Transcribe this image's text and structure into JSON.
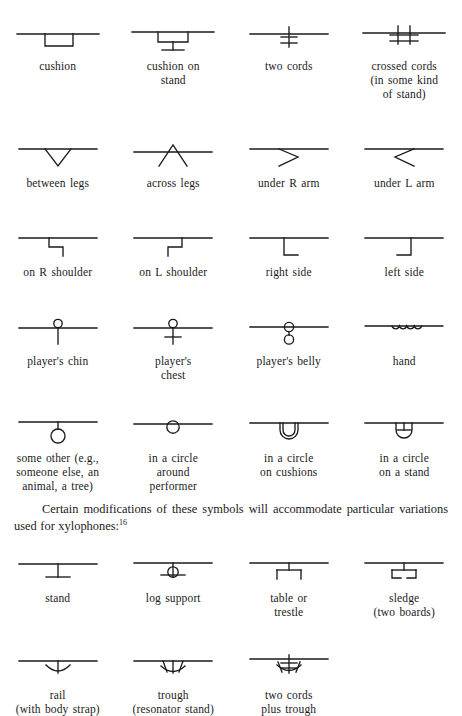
{
  "document": {
    "title": "Notation symbols for instrument support and playing position",
    "paragraph": {
      "text": "Certain modifications of these symbols will accommodate particular variations used for xylophones:",
      "footnote_marker": "16"
    }
  },
  "symbol_rows": [
    {
      "row_id": "row-1",
      "symbols": [
        {
          "name": "cushion",
          "caption_lines": [
            "cushion"
          ],
          "glyph": "cushion"
        },
        {
          "name": "cushion-on-stand",
          "caption_lines": [
            "cushion on",
            "stand"
          ],
          "glyph": "cushion-on-stand"
        },
        {
          "name": "two-cords",
          "caption_lines": [
            "two cords"
          ],
          "glyph": "two-cords"
        },
        {
          "name": "crossed-cords",
          "caption_lines": [
            "crossed cords",
            "(in some kind",
            "of stand)"
          ],
          "glyph": "crossed-cords"
        }
      ]
    },
    {
      "row_id": "row-2",
      "symbols": [
        {
          "name": "between-legs",
          "caption_lines": [
            "between legs"
          ],
          "glyph": "between-legs"
        },
        {
          "name": "across-legs",
          "caption_lines": [
            "across legs"
          ],
          "glyph": "across-legs"
        },
        {
          "name": "under-r-arm",
          "caption_lines": [
            "under R arm"
          ],
          "glyph": "under-r-arm"
        },
        {
          "name": "under-l-arm",
          "caption_lines": [
            "under L arm"
          ],
          "glyph": "under-l-arm"
        }
      ]
    },
    {
      "row_id": "row-3",
      "symbols": [
        {
          "name": "on-r-shoulder",
          "caption_lines": [
            "on R shoulder"
          ],
          "glyph": "on-r-shoulder"
        },
        {
          "name": "on-l-shoulder",
          "caption_lines": [
            "on L shoulder"
          ],
          "glyph": "on-l-shoulder"
        },
        {
          "name": "right-side",
          "caption_lines": [
            "right side"
          ],
          "glyph": "right-side"
        },
        {
          "name": "left-side",
          "caption_lines": [
            "left side"
          ],
          "glyph": "left-side"
        }
      ]
    },
    {
      "row_id": "row-4",
      "symbols": [
        {
          "name": "players-chin",
          "caption_lines": [
            "player's chin"
          ],
          "glyph": "players-chin"
        },
        {
          "name": "players-chest",
          "caption_lines": [
            "player's",
            "chest"
          ],
          "glyph": "players-chest"
        },
        {
          "name": "players-belly",
          "caption_lines": [
            "player's belly"
          ],
          "glyph": "players-belly"
        },
        {
          "name": "hand",
          "caption_lines": [
            "hand"
          ],
          "glyph": "hand"
        }
      ]
    },
    {
      "row_id": "row-5",
      "symbols": [
        {
          "name": "some-other",
          "caption_lines": [
            "some other (e.g.,",
            "someone else, an",
            "animal, a tree)"
          ],
          "glyph": "some-other"
        },
        {
          "name": "in-a-circle-around-performer",
          "caption_lines": [
            "in a circle",
            "around",
            "performer"
          ],
          "glyph": "in-a-circle"
        },
        {
          "name": "in-a-circle-on-cushions",
          "caption_lines": [
            "in a circle",
            "on cushions"
          ],
          "glyph": "in-a-circle-on-cushions"
        },
        {
          "name": "in-a-circle-on-a-stand",
          "caption_lines": [
            "in a circle",
            "on a stand"
          ],
          "glyph": "in-a-circle-on-a-stand"
        }
      ]
    },
    {
      "row_id": "row-6",
      "symbols": [
        {
          "name": "stand",
          "caption_lines": [
            "stand"
          ],
          "glyph": "stand"
        },
        {
          "name": "log-support",
          "caption_lines": [
            "log support"
          ],
          "glyph": "log-support"
        },
        {
          "name": "table-or-trestle",
          "caption_lines": [
            "table or",
            "trestle"
          ],
          "glyph": "table-or-trestle"
        },
        {
          "name": "sledge",
          "caption_lines": [
            "sledge",
            "(two boards)"
          ],
          "glyph": "sledge"
        }
      ]
    },
    {
      "row_id": "row-7",
      "symbols": [
        {
          "name": "rail",
          "caption_lines": [
            "rail",
            "(with body strap)"
          ],
          "glyph": "rail"
        },
        {
          "name": "trough",
          "caption_lines": [
            "trough",
            "(resonator stand)"
          ],
          "glyph": "trough"
        },
        {
          "name": "two-cords-plus-trough",
          "caption_lines": [
            "two cords",
            "plus trough"
          ],
          "glyph": "two-cords-plus-trough"
        },
        {
          "name": "empty",
          "caption_lines": [],
          "glyph": "none"
        }
      ]
    }
  ],
  "colors": {
    "ink": "#1a1a1a",
    "background": "#ffffff"
  }
}
